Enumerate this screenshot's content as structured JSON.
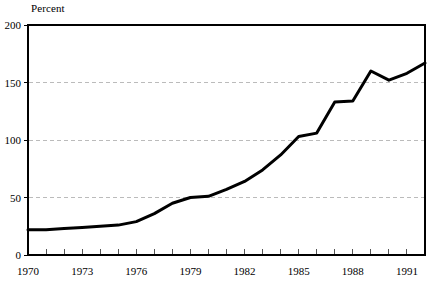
{
  "chart_data": {
    "type": "line",
    "title": "",
    "subtitle": "",
    "xlabel": "",
    "ylabel": "Percent",
    "ylabel_position": "top-left",
    "xlim": [
      1970,
      1992
    ],
    "ylim": [
      0,
      200
    ],
    "yticks": [
      0,
      50,
      100,
      150,
      200
    ],
    "ytick_labels": [
      "0",
      "50",
      "100",
      "150",
      "200"
    ],
    "xticks": [
      1970,
      1971,
      1972,
      1973,
      1974,
      1975,
      1976,
      1977,
      1978,
      1979,
      1980,
      1981,
      1982,
      1983,
      1984,
      1985,
      1986,
      1987,
      1988,
      1989,
      1990,
      1991,
      1992
    ],
    "xtick_labels_shown": [
      "1970",
      "1973",
      "1976",
      "1979",
      "1982",
      "1985",
      "1988",
      "1991"
    ],
    "xtick_label_interval": 3,
    "grid": "horizontal-dashed",
    "grid_color": "#bbbbbb",
    "line_color": "#000000",
    "line_width": 3,
    "plot_border_color": "#000000",
    "background_color": "#ffffff",
    "legend": "none",
    "x": [
      1970,
      1971,
      1972,
      1973,
      1974,
      1975,
      1976,
      1977,
      1978,
      1979,
      1980,
      1981,
      1982,
      1983,
      1984,
      1985,
      1986,
      1987,
      1988,
      1989,
      1990,
      1991,
      1992
    ],
    "values": [
      22,
      22,
      23,
      24,
      25,
      26,
      29,
      36,
      45,
      50,
      51,
      57,
      64,
      74,
      87,
      103,
      106,
      133,
      134,
      160,
      152,
      158,
      167
    ],
    "series": [
      {
        "name": "Percent",
        "values": [
          22,
          22,
          23,
          24,
          25,
          26,
          29,
          36,
          45,
          50,
          51,
          57,
          64,
          74,
          87,
          103,
          106,
          133,
          134,
          160,
          152,
          158,
          167
        ]
      }
    ]
  },
  "layout": {
    "plot_left": 28,
    "plot_right": 425,
    "plot_top": 25,
    "plot_bottom": 255
  }
}
